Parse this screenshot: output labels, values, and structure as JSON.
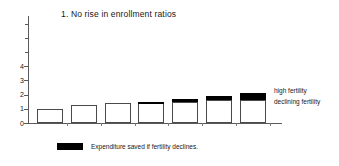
{
  "chart_data": {
    "type": "bar",
    "title": "1. No rise in enrollment ratios",
    "xlabel": "",
    "ylabel": "",
    "ylim": [
      0,
      7.5
    ],
    "yticks": [
      0,
      1,
      2,
      3,
      4
    ],
    "ytick_labels": [
      "0",
      "1",
      "2",
      "3",
      "4"
    ],
    "grid": false,
    "categories": [
      "1",
      "2",
      "3",
      "4",
      "5",
      "6",
      "7"
    ],
    "series": [
      {
        "name": "declining fertility",
        "color": "#ffffff",
        "values": [
          1.0,
          1.3,
          1.4,
          1.4,
          1.5,
          1.6,
          1.6
        ]
      },
      {
        "name": "Expenditure saved if fertility declines.",
        "color": "#000000",
        "values": [
          0.0,
          0.0,
          0.0,
          0.1,
          0.2,
          0.3,
          0.5
        ]
      }
    ],
    "totals": [
      1.0,
      1.3,
      1.4,
      1.5,
      1.7,
      1.9,
      2.1
    ],
    "annotations": [
      {
        "id": "high",
        "text": "high fertility"
      },
      {
        "id": "declining",
        "text": "declining fertility"
      }
    ],
    "legend": {
      "position": "bottom-left",
      "entries": [
        {
          "label": "Expenditure saved if fertility declines.",
          "color": "#000000"
        }
      ]
    }
  },
  "legend_label": "Expenditure saved if fertility declines."
}
